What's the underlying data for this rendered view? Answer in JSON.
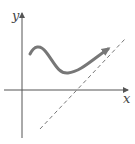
{
  "diagram": {
    "axes": {
      "x_label": "x",
      "y_label": "y",
      "axis_color": "#555555"
    },
    "curve": {
      "description": "smooth curve rising to local max, dipping to local min, then rising with arrowhead",
      "color": "#777777",
      "has_arrow": true
    },
    "asymptote": {
      "style": "dashed",
      "color": "#777777",
      "description": "slanted dashed asymptote line"
    }
  }
}
